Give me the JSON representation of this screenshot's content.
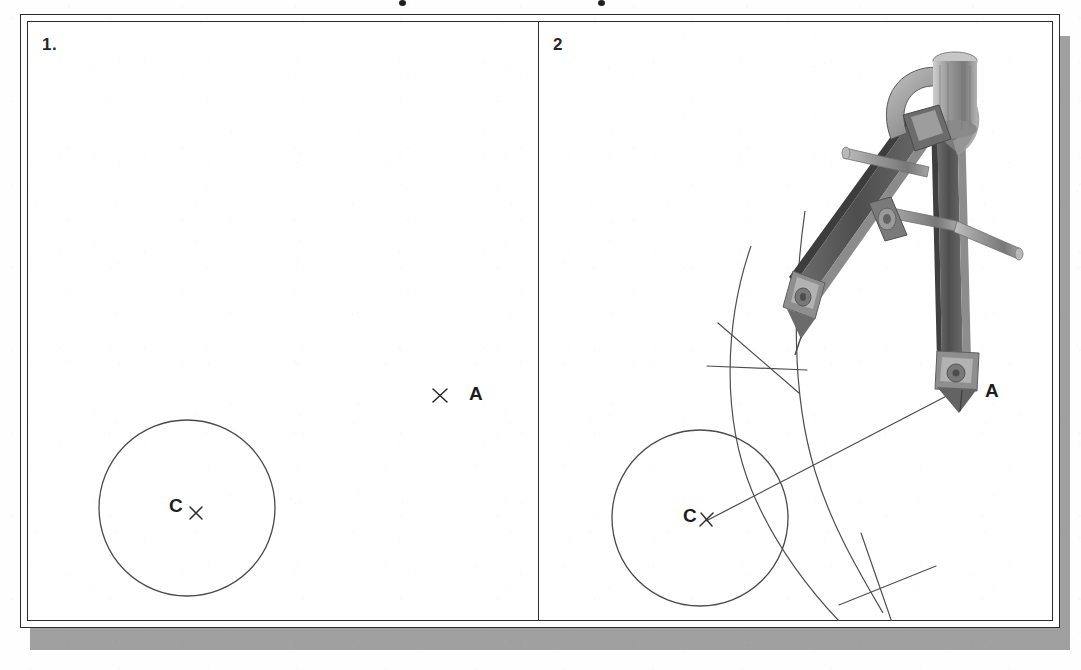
{
  "figure": {
    "title_visible": false,
    "background_color": "#fefefe",
    "frame_color": "#2b2b2b",
    "shadow_color": "#a0a0a0",
    "ink_color": "#3a3a3a",
    "label_color": "#1d1d1d"
  },
  "panels": [
    {
      "number": "1.",
      "name": "panel-one",
      "description": "Given circle with centre C and external point A",
      "elements": {
        "circle": {
          "label": "C",
          "center_x": 187,
          "center_y": 508,
          "radius": 88
        },
        "center_mark": {
          "type": "x-mark",
          "x": 196,
          "y": 513
        },
        "point_a": {
          "label": "A",
          "mark_x": 440,
          "mark_y": 396,
          "label_x": 470,
          "label_y": 390
        }
      }
    },
    {
      "number": "2",
      "name": "panel-two",
      "description": "Compass swings two arcs from A and C; their intersections define the perpendicular bisector of CA",
      "elements": {
        "circle": {
          "label": "C",
          "center_x": 700,
          "center_y": 518,
          "radius": 88
        },
        "center_mark": {
          "type": "x-mark",
          "x": 706,
          "y": 521
        },
        "point_a": {
          "label": "A",
          "mark_x": 962,
          "mark_y": 388,
          "label_x": 985,
          "label_y": 380
        },
        "line_ca": {
          "from": "C",
          "to": "A"
        },
        "arc_upper_intersection": {
          "x": 762,
          "y": 355
        },
        "arc_lower_intersection": {
          "x": 885,
          "y": 562
        },
        "tool": {
          "name": "drawing-compass",
          "parts": [
            "knurled-knob",
            "hinge-head",
            "pencil-leg",
            "needle-leg",
            "extension-bar",
            "adjust-screw"
          ],
          "body_color": "#585858",
          "highlight_color": "#a9a9a9",
          "metal_color": "#8e8e8e"
        }
      }
    }
  ],
  "colors": {
    "ink": "#3a3a3a",
    "frame": "#2b2b2b",
    "shadow": "#a0a0a0",
    "compass_dark": "#585858",
    "compass_mid": "#7b7b7b",
    "compass_light": "#aeaeae"
  }
}
